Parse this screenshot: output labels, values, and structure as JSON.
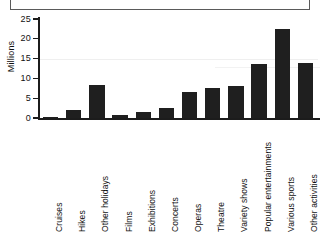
{
  "caption": {
    "text": ""
  },
  "chart_data": {
    "type": "bar",
    "title": "",
    "subtitle": "",
    "xlabel": "",
    "ylabel": "Millions",
    "ylim": [
      0,
      25
    ],
    "ytick_labels": [
      "25",
      "20",
      "15",
      "10",
      "5",
      "0"
    ],
    "ytick_values": [
      25,
      20,
      15,
      10,
      5,
      0
    ],
    "grid": false,
    "legend": false,
    "legend_position": "none",
    "bar_color": "#1f1f1f",
    "axis_color": "#1c1c1c",
    "categories": [
      "Cruises",
      "Hikes",
      "Other holidays",
      "Films",
      "Exhibitions",
      "Concerts",
      "Operas",
      "Theatre",
      "Variety shows",
      "Popular entertainments",
      "Various sports",
      "Other activities"
    ],
    "values": [
      0.3,
      2.0,
      8.3,
      0.8,
      1.6,
      2.5,
      6.6,
      7.5,
      8.0,
      13.7,
      22.4,
      13.8
    ],
    "units": "Millions"
  }
}
